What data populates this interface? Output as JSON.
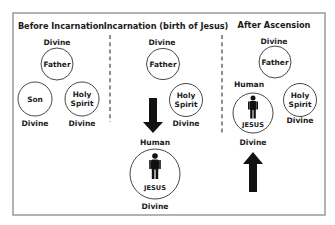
{
  "diagram": {
    "colors": {
      "frame": "#8a8a8a",
      "ink": "#1a1a1a",
      "arrow": "#111111"
    },
    "panels": [
      {
        "heading": "Before Incarnation",
        "top_label": "Divine",
        "nodes": [
          {
            "label": "Father"
          },
          {
            "label": "Son",
            "below": "Divine"
          },
          {
            "label_line1": "Holy",
            "label_line2": "Spirit",
            "below": "Divine"
          }
        ]
      },
      {
        "heading": "Incarnation (birth of Jesus)",
        "top_label": "Divine",
        "nodes": [
          {
            "label": "Father"
          },
          {
            "label_line1": "Holy",
            "label_line2": "Spirit",
            "below": "Divine"
          }
        ],
        "arrow": "down-arrow",
        "jesus": {
          "above": "Human",
          "label": "JESUS",
          "below": "Divine",
          "icon": "person-icon"
        }
      },
      {
        "heading": "After Ascension",
        "top_label": "Divine",
        "nodes": [
          {
            "label": "Father"
          },
          {
            "label_line1": "Holy",
            "label_line2": "Spirit",
            "below": "Divine"
          }
        ],
        "jesus": {
          "above": "Human",
          "label": "JESUS",
          "below": "Divine",
          "icon": "person-icon"
        },
        "arrow": "up-arrow"
      }
    ]
  }
}
